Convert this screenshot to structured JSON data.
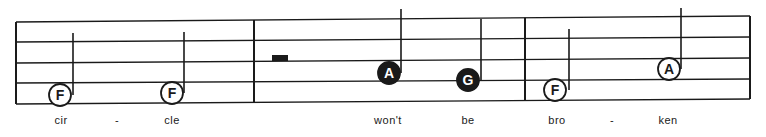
{
  "staff": {
    "left_x": 16,
    "right_x": 750,
    "lines_left_y": [
      22,
      42,
      63,
      83,
      104
    ],
    "lines_right_y": [
      16,
      37,
      58,
      79,
      99
    ],
    "barlines_x": [
      16,
      254,
      525,
      750
    ],
    "ink_color": "#1a1a1a"
  },
  "measures": [
    {
      "index": 1,
      "notes": [
        {
          "letter": "F",
          "style": "open",
          "cx": 60,
          "cy": 95,
          "stem_x": 73,
          "stem_top": 33
        },
        {
          "letter": "F",
          "style": "open",
          "cx": 172,
          "cy": 93,
          "stem_x": 184,
          "stem_top": 32
        }
      ]
    },
    {
      "index": 2,
      "rest": {
        "type": "half-rest",
        "x": 272,
        "y": 55,
        "w": 16,
        "h": 6
      },
      "notes": [
        {
          "letter": "A",
          "style": "filled",
          "cx": 389,
          "cy": 73,
          "stem_x": 401,
          "stem_top": 9
        },
        {
          "letter": "G",
          "style": "filled",
          "cx": 468,
          "cy": 80,
          "stem_x": 481,
          "stem_top": 19
        }
      ]
    },
    {
      "index": 3,
      "notes": [
        {
          "letter": "F",
          "style": "open",
          "cx": 555,
          "cy": 90,
          "stem_x": 569,
          "stem_top": 29
        },
        {
          "letter": "A",
          "style": "open",
          "cx": 669,
          "cy": 69,
          "stem_x": 681,
          "stem_top": 8
        }
      ]
    }
  ],
  "lyrics": [
    {
      "text": "cir",
      "x": 61
    },
    {
      "text": "-",
      "x": 117
    },
    {
      "text": "cle",
      "x": 172
    },
    {
      "text": "won't",
      "x": 388
    },
    {
      "text": "be",
      "x": 468
    },
    {
      "text": "bro",
      "x": 557
    },
    {
      "text": "-",
      "x": 612
    },
    {
      "text": "ken",
      "x": 668
    }
  ]
}
